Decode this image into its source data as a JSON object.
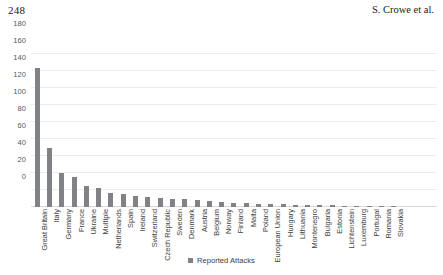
{
  "page": {
    "folio": "248",
    "running_title": "S. Crowe et al."
  },
  "legend": {
    "entries": [
      {
        "label": "Reported Attacks",
        "color": "#808285",
        "marker": "square"
      }
    ],
    "position": "bottom-center"
  },
  "colors": {
    "bar": "#808285",
    "gridline": "#eceded",
    "axis_text": "#58595b",
    "label_text": "#414042"
  },
  "chart_data": {
    "type": "bar",
    "title": "",
    "subtitle": "",
    "xlabel": "",
    "ylabel": "",
    "ylim": [
      0,
      180
    ],
    "yticks": [
      0,
      20,
      40,
      60,
      80,
      100,
      120,
      140,
      160,
      180
    ],
    "ytick_labels": [
      "0",
      "20",
      "40",
      "60",
      "80",
      "100",
      "120",
      "140",
      "160",
      "180"
    ],
    "grid": true,
    "grid_axis": "y",
    "legend_entries": [
      "Reported Attacks"
    ],
    "series_name": "Reported Attacks",
    "categories": [
      "Great Britain",
      "Italy",
      "Germany",
      "France",
      "Ukraine",
      "Multiple",
      "Netherlands",
      "Spain",
      "Ireland",
      "Switzerland",
      "Czech Republic",
      "Sweden",
      "Denmark",
      "Austria",
      "Belgium",
      "Norway",
      "Finland",
      "Malta",
      "Poland",
      "European Union",
      "Hungary",
      "Lithuania",
      "Montenegro",
      "Bulgaria",
      "Estonia",
      "Lichtenstein",
      "Luxemburg",
      "Portugal",
      "Romania",
      "Slovakia"
    ],
    "values": [
      163,
      70,
      40,
      35,
      25,
      22,
      17,
      15,
      13,
      12,
      11,
      10,
      9,
      8,
      7,
      6,
      5,
      5,
      4,
      3,
      3,
      2,
      2,
      2,
      2,
      1,
      1,
      1,
      1,
      1
    ]
  }
}
